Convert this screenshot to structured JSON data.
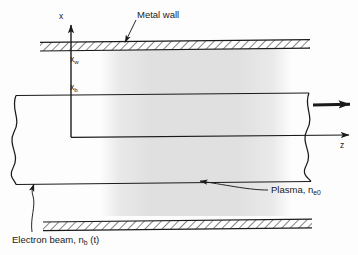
{
  "figure": {
    "type": "schematic-diagram",
    "background_color": "#fdfdfd",
    "line_color": "#1a1a1a",
    "plasma_fill_color": "#e2e2e2"
  },
  "axes": {
    "x_label": "x",
    "z_label": "z",
    "x_wall_label": "x",
    "x_wall_sub": "w",
    "x_beam_label": "x",
    "x_beam_sub": "b"
  },
  "annotations": {
    "metal_wall": "Metal wall",
    "plasma_text": "Plasma, n",
    "plasma_sub": "e0",
    "beam_text": "Electron beam, n",
    "beam_sub": "b",
    "beam_suffix": " (t)"
  },
  "geometry": {
    "top_wall_y": 42,
    "bottom_wall_y": 216,
    "beam_top_y": 93,
    "beam_bottom_y": 182,
    "axis_z_y": 137,
    "axis_x_x": 71,
    "plasma_left_x": 103,
    "plasma_right_x": 287
  }
}
